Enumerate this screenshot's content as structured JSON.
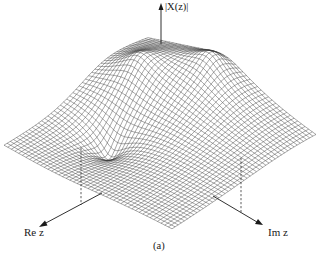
{
  "figure": {
    "caption": "(a)",
    "axis_labels": {
      "vertical": "|X(z)|",
      "real": "Re z",
      "imaginary": "Im z"
    },
    "colors": {
      "ink": "#1a1a1a",
      "mesh": "#3a3a3a",
      "background": "#ffffff"
    }
  },
  "chart_data": {
    "type": "surface",
    "title": "",
    "axes": {
      "vertical": "|X(z)|",
      "x": "Re z",
      "y": "Im z"
    },
    "features": [
      {
        "kind": "peak",
        "label": "pole (left, taller)",
        "relative_height": 1.0
      },
      {
        "kind": "peak",
        "label": "pole (right)",
        "relative_height": 0.8
      },
      {
        "kind": "dip",
        "label": "zero",
        "relative_height": -0.2
      }
    ],
    "grid": true,
    "caption": "(a)"
  }
}
